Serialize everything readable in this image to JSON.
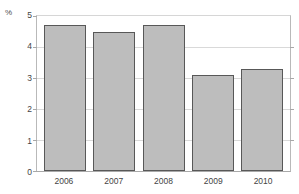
{
  "chart_data": {
    "type": "bar",
    "title": "",
    "subtitle": "",
    "xlabel": "",
    "ylabel": "%",
    "categories": [
      "2006",
      "2007",
      "2008",
      "2009",
      "2010"
    ],
    "values": [
      4.7,
      4.5,
      4.7,
      3.1,
      3.3
    ],
    "ylim": [
      0,
      5
    ],
    "ytick_labels": [
      "0",
      "1",
      "2",
      "3",
      "4",
      "5"
    ],
    "ytick_values": [
      0,
      1,
      2,
      3,
      4,
      5
    ],
    "grid": "horizontal",
    "legend": "none",
    "series": [
      {
        "name": "",
        "values": [
          4.7,
          4.5,
          4.7,
          3.1,
          3.3
        ]
      }
    ],
    "colors": {
      "bar_fill": "#bdbdbd",
      "bar_border": "#585858",
      "gridline": "#d9d9d9",
      "axis": "#b9b9b9",
      "text": "#444444",
      "background": "#ffffff"
    }
  }
}
